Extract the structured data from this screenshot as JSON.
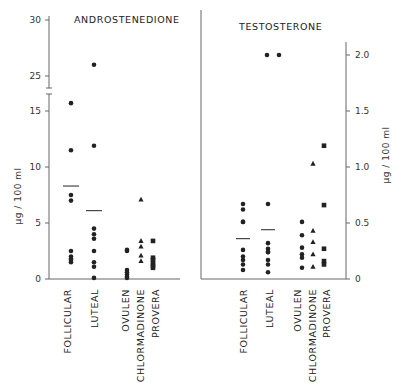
{
  "chart_data": [
    {
      "type": "scatter",
      "title": "ANDROSTENEDIONE",
      "ylabel": "µg / 100 ml",
      "ylim": [
        0,
        30
      ],
      "axis_break": [
        17,
        24
      ],
      "yticks": [
        "0",
        "5",
        "10",
        "15",
        "25",
        "30"
      ],
      "categories": [
        "FOLLICULAR",
        "LUTEAL",
        "OVULEN",
        "CHLORMADINONE",
        "PROVERA"
      ],
      "series": [
        {
          "name": "FOLLICULAR",
          "marker": "circle",
          "values": [
            15.7,
            11.5,
            7.5,
            7.0,
            2.5,
            2.0,
            1.8,
            1.7,
            1.5
          ],
          "mean": 8.3
        },
        {
          "name": "LUTEAL",
          "marker": "circle",
          "values": [
            26.0,
            11.9,
            4.5,
            4.0,
            3.6,
            2.5,
            1.5,
            1.1,
            0.1
          ],
          "mean": 6.1
        },
        {
          "name": "OVULEN",
          "marker": "circle",
          "values": [
            2.6,
            2.5,
            0.8,
            0.6,
            0.4,
            0.2,
            0.1
          ]
        },
        {
          "name": "CHLORMADINONE",
          "marker": "triangle",
          "values": [
            7.1,
            3.4,
            2.9,
            2.1,
            1.6
          ]
        },
        {
          "name": "PROVERA",
          "marker": "square",
          "values": [
            3.4,
            1.9,
            1.7,
            1.4,
            1.2,
            1.0
          ]
        }
      ]
    },
    {
      "type": "scatter",
      "title": "TESTOSTERONE",
      "ylabel": "µg / 100 ml",
      "ylim": [
        0,
        2.1
      ],
      "yticks": [
        "0",
        "0.5",
        "1.0",
        "1.5",
        "2.0"
      ],
      "categories": [
        "FOLLICULAR",
        "LUTEAL",
        "OVULEN",
        "CHLORMADINONE",
        "PROVERA"
      ],
      "series": [
        {
          "name": "FOLLICULAR",
          "marker": "circle",
          "values": [
            0.67,
            0.62,
            0.51,
            0.51,
            0.26,
            0.2,
            0.17,
            0.13,
            0.08
          ],
          "mean": 0.36
        },
        {
          "name": "LUTEAL",
          "marker": "circle",
          "values": [
            2.0,
            2.0,
            0.67,
            0.32,
            0.27,
            0.24,
            0.24,
            0.17,
            0.13,
            0.06
          ],
          "mean": 0.44
        },
        {
          "name": "OVULEN",
          "marker": "circle",
          "values": [
            0.51,
            0.39,
            0.28,
            0.22,
            0.19,
            0.1
          ]
        },
        {
          "name": "CHLORMADINONE",
          "marker": "triangle",
          "values": [
            1.03,
            0.43,
            0.33,
            0.22,
            0.11
          ]
        },
        {
          "name": "PROVERA",
          "marker": "square",
          "values": [
            1.19,
            0.66,
            0.27,
            0.16,
            0.13
          ]
        }
      ]
    }
  ],
  "panels": {
    "left": {
      "title": "ANDROSTENEDIONE",
      "ylabel": "µg / 100 ml"
    },
    "right": {
      "title": "TESTOSTERONE",
      "ylabel": "µg / 100 ml"
    }
  },
  "categories": [
    "FOLLICULAR",
    "LUTEAL",
    "OVULEN",
    "CHLORMADINONE",
    "PROVERA"
  ]
}
